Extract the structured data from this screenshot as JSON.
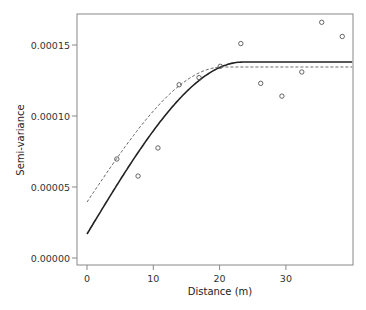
{
  "chart_data": {
    "type": "scatter",
    "title": "",
    "xlabel": "Distance (m)",
    "ylabel": "Semi-variance",
    "xlim": [
      -1.5,
      40
    ],
    "ylim": [
      -5e-06,
      0.000175
    ],
    "xticks": [
      0,
      10,
      20,
      30
    ],
    "xtick_labels": [
      "0",
      "10",
      "20",
      "30"
    ],
    "yticks": [
      0.0,
      5e-05,
      0.0001,
      0.00015
    ],
    "ytick_labels": [
      "0.00000",
      "0.00005",
      "0.00010",
      "0.00015"
    ],
    "grid": false,
    "legend": null,
    "series": [
      {
        "name": "empirical semi-variance",
        "type": "scatter",
        "marker": "open-circle",
        "color": "#555555",
        "x": [
          4.5,
          7.7,
          10.7,
          13.9,
          16.9,
          20.1,
          23.2,
          26.2,
          29.4,
          32.4,
          35.4,
          38.5
        ],
        "values": [
          6.97e-05,
          5.77e-05,
          7.75e-05,
          0.000122,
          0.000127,
          0.000135,
          0.000151,
          0.000123,
          0.000114,
          0.000131,
          0.000166,
          0.000156
        ]
      },
      {
        "name": "fitted spherical model (solid)",
        "type": "line",
        "style": "solid",
        "color": "#222222",
        "model": "spherical",
        "nugget": 1.69e-05,
        "sill": 0.000138,
        "range": 23.5
      },
      {
        "name": "fitted spherical model (dashed)",
        "type": "line",
        "style": "dashed",
        "color": "#666666",
        "model": "spherical",
        "nugget": 3.94e-05,
        "sill": 0.0001345,
        "range": 20.5
      }
    ]
  },
  "axes": {
    "x_title": "Distance (m)",
    "y_title": "Semi-variance"
  }
}
